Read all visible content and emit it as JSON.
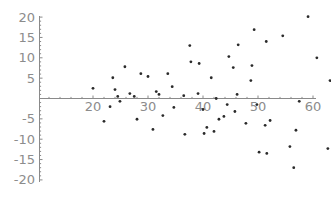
{
  "chart_data": {
    "type": "scatter",
    "title": "",
    "xlabel": "",
    "ylabel": "",
    "xlim": [
      10.3,
      61
    ],
    "ylim": [
      -20,
      20
    ],
    "x_axis_crosses_y_at": 0,
    "y_axis_crosses_x_at": 10.3,
    "grid": false,
    "legend": null,
    "x_ticks": [
      20,
      30,
      40,
      50,
      60
    ],
    "y_ticks": [
      -20,
      -15,
      -10,
      -5,
      5,
      10,
      15,
      20
    ],
    "x_tick_labels": [
      "20",
      "30",
      "40",
      "50",
      "60"
    ],
    "y_tick_labels": [
      "-20",
      "-15",
      "-10",
      "-5",
      "5",
      "10",
      "15",
      "20"
    ],
    "series": [
      {
        "name": "data",
        "marker": "dot",
        "color": "#2a2a2a",
        "points": [
          [
            20.0,
            2.5
          ],
          [
            22.0,
            -5.6
          ],
          [
            23.1,
            -2.0
          ],
          [
            23.6,
            5.1
          ],
          [
            24.0,
            2.2
          ],
          [
            24.5,
            0.5
          ],
          [
            24.9,
            -0.7
          ],
          [
            25.8,
            7.8
          ],
          [
            26.7,
            1.2
          ],
          [
            27.5,
            0.5
          ],
          [
            28.0,
            -5.1
          ],
          [
            28.7,
            6.1
          ],
          [
            30.0,
            5.4
          ],
          [
            30.9,
            -7.6
          ],
          [
            31.5,
            1.7
          ],
          [
            32.0,
            1.0
          ],
          [
            32.7,
            -4.2
          ],
          [
            33.6,
            6.1
          ],
          [
            34.4,
            2.9
          ],
          [
            34.7,
            -2.2
          ],
          [
            36.5,
            0.7
          ],
          [
            36.7,
            -8.8
          ],
          [
            37.6,
            13.0
          ],
          [
            37.8,
            9.0
          ],
          [
            39.1,
            1.2
          ],
          [
            39.3,
            8.6
          ],
          [
            40.0,
            -2.7
          ],
          [
            40.2,
            -8.6
          ],
          [
            40.7,
            -7.1
          ],
          [
            41.5,
            5.1
          ],
          [
            42.0,
            -8.1
          ],
          [
            42.4,
            0.0
          ],
          [
            42.9,
            -5.1
          ],
          [
            43.8,
            -4.4
          ],
          [
            44.4,
            -1.5
          ],
          [
            44.7,
            10.3
          ],
          [
            45.5,
            7.6
          ],
          [
            45.8,
            -3.2
          ],
          [
            46.2,
            1.0
          ],
          [
            46.4,
            13.2
          ],
          [
            47.8,
            -6.1
          ],
          [
            48.7,
            4.4
          ],
          [
            48.9,
            8.1
          ],
          [
            49.3,
            16.9
          ],
          [
            49.8,
            -1.5
          ],
          [
            50.2,
            -13.2
          ],
          [
            51.3,
            -6.6
          ],
          [
            51.5,
            14.0
          ],
          [
            51.6,
            -13.5
          ],
          [
            52.2,
            -5.4
          ],
          [
            54.5,
            15.4
          ],
          [
            55.8,
            -11.8
          ],
          [
            56.5,
            -17.0
          ],
          [
            56.9,
            -7.8
          ],
          [
            57.5,
            -0.7
          ],
          [
            59.1,
            20.1
          ],
          [
            60.7,
            10.0
          ],
          [
            62.7,
            -12.3
          ],
          [
            63.1,
            4.4
          ]
        ]
      }
    ]
  }
}
